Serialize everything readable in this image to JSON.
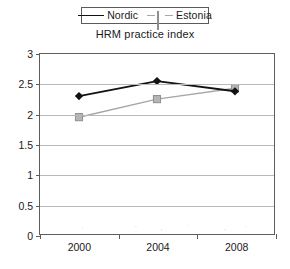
{
  "chart_data": {
    "type": "line",
    "title": "HRM practice index",
    "xlabel": "",
    "ylabel": "",
    "categories": [
      "2000",
      "2004",
      "2008"
    ],
    "x": [
      2000,
      2004,
      2008
    ],
    "series": [
      {
        "name": "Nordic",
        "values": [
          2.3,
          2.55,
          2.38
        ],
        "color": "#121212",
        "marker": "diamond",
        "line_style": "solid"
      },
      {
        "name": "Estonia",
        "values": [
          1.95,
          2.25,
          2.43
        ],
        "color": "#a6a6a6",
        "marker": "square",
        "line_style": "solid"
      }
    ],
    "ylim": [
      0,
      3
    ],
    "ytick_values": [
      0,
      0.5,
      1,
      1.5,
      2,
      2.5,
      3
    ],
    "ytick_labels": [
      "0",
      "0.5",
      "1",
      "1.5",
      "2",
      "2.5",
      "3"
    ],
    "xtick_labels": [
      "2000",
      "2004",
      "2008"
    ],
    "grid": "horizontal",
    "legend_position": "top-center"
  },
  "legend": {
    "entries": [
      {
        "label": "Nordic"
      },
      {
        "label": "Estonia"
      }
    ]
  }
}
